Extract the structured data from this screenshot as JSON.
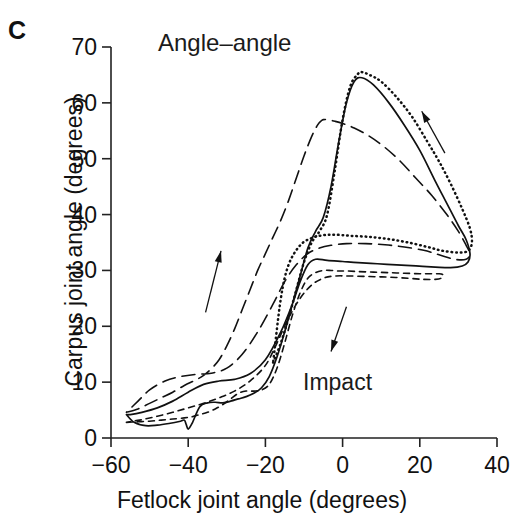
{
  "panel": {
    "label": "C"
  },
  "chart_data": {
    "type": "line",
    "title": "Angle–angle",
    "xlabel": "Fetlock joint angle (degrees)",
    "ylabel": "Carpus joint angle (degrees)",
    "xlim": [
      -60,
      40
    ],
    "ylim": [
      0,
      70
    ],
    "xticks": [
      -60,
      -40,
      -20,
      0,
      20,
      40
    ],
    "yticks": [
      0,
      10,
      20,
      30,
      40,
      50,
      60,
      70
    ],
    "xtick_labels": [
      "−60",
      "−40",
      "−20",
      "0",
      "20",
      "40"
    ],
    "ytick_labels": [
      "0",
      "10",
      "20",
      "30",
      "40",
      "50",
      "60",
      "70"
    ],
    "grid": false,
    "legend": "none",
    "annotations": [
      {
        "text": "Impact",
        "x": -2,
        "y": 12,
        "note": "arrow points down-left toward descending limb"
      },
      {
        "text": "",
        "x": 22,
        "y": 57,
        "note": "arrow pointing up-left along ascending right limb"
      },
      {
        "text": "",
        "x": -32,
        "y": 33,
        "note": "arrow pointing up along ascending left limb"
      }
    ],
    "series": [
      {
        "name": "solid",
        "style": "solid",
        "x": [
          -56,
          -54,
          -51,
          -48,
          -45,
          -42,
          -41,
          -40.5,
          -40,
          -39,
          -37,
          -35,
          -33,
          -31,
          -29,
          -27,
          -25,
          -23,
          -21,
          -19,
          -17,
          -15,
          -13,
          -11,
          -9,
          -7,
          -5,
          -3,
          -1,
          1,
          3,
          5,
          8,
          12,
          16,
          20,
          24,
          27,
          30,
          32,
          33,
          32.5,
          31,
          28,
          24,
          19,
          14,
          9,
          4,
          0,
          -4,
          -7,
          -9,
          -11,
          -13,
          -16,
          -20,
          -24,
          -28,
          -32,
          -36,
          -40,
          -44,
          -48,
          -52,
          -55,
          -56
        ],
        "y": [
          4.2,
          2.8,
          2.2,
          2.3,
          2.6,
          3.0,
          3.2,
          2.4,
          1.6,
          2.6,
          5.6,
          6.3,
          6.4,
          6.3,
          6.6,
          7.0,
          7.4,
          8.0,
          9.0,
          11.0,
          14.5,
          19.0,
          24.0,
          29.0,
          34.0,
          37.0,
          39.5,
          45.0,
          53.0,
          60.0,
          63.8,
          64.5,
          63.2,
          60.0,
          56.0,
          51.5,
          46.0,
          42.0,
          38.0,
          35.5,
          33.0,
          31.5,
          30.8,
          30.5,
          30.6,
          30.8,
          31.0,
          31.2,
          31.4,
          31.6,
          31.8,
          32.0,
          31.0,
          28.0,
          24.0,
          19.0,
          14.0,
          11.5,
          10.5,
          10.2,
          9.6,
          8.2,
          6.6,
          5.4,
          4.6,
          4.2,
          4.2
        ]
      },
      {
        "name": "dotted",
        "style": "dotted",
        "x": [
          -18,
          -16,
          -14,
          -12,
          -10,
          -8,
          -6,
          -4,
          -2,
          0,
          2,
          4,
          5,
          7,
          10,
          14,
          18,
          22,
          25,
          28,
          31,
          33,
          33.5,
          32.5,
          30,
          26,
          22,
          17,
          12,
          7,
          2,
          -2,
          -5,
          -8,
          -11,
          -14,
          -16,
          -18
        ],
        "y": [
          13.5,
          17.0,
          21.5,
          26.5,
          31.5,
          35.0,
          37.0,
          40.0,
          48.0,
          57.0,
          63.0,
          65.2,
          65.5,
          65.0,
          63.8,
          61.0,
          57.5,
          53.0,
          49.5,
          45.5,
          41.0,
          37.5,
          35.0,
          33.5,
          33.2,
          33.5,
          34.2,
          35.0,
          35.6,
          36.0,
          36.2,
          36.4,
          36.3,
          35.8,
          34.5,
          31.0,
          25.0,
          13.5
        ]
      },
      {
        "name": "long-dash",
        "style": "long-dash",
        "x": [
          -56,
          -53,
          -50,
          -47,
          -44,
          -41,
          -38,
          -36,
          -34,
          -32,
          -30,
          -28,
          -26,
          -24,
          -22,
          -20,
          -18,
          -16,
          -14,
          -12,
          -10,
          -8,
          -6.5,
          -5.5,
          -5,
          -4,
          -2,
          0,
          3,
          7,
          11,
          15,
          19,
          23,
          27,
          30,
          32,
          33,
          32,
          29,
          25,
          21,
          16,
          11,
          6,
          1,
          -3,
          -6,
          -9,
          -12,
          -15,
          -18,
          -22,
          -26,
          -30,
          -34,
          -38,
          -42,
          -46,
          -50,
          -53,
          -56
        ],
        "y": [
          4.6,
          5.2,
          6.2,
          7.2,
          8.2,
          9.4,
          10.4,
          11.2,
          12.4,
          14.0,
          16.5,
          19.5,
          23.0,
          26.5,
          30.0,
          33.0,
          36.0,
          39.0,
          42.5,
          46.5,
          50.5,
          54.0,
          56.0,
          56.8,
          57.0,
          57.0,
          56.7,
          56.3,
          55.5,
          54.0,
          52.0,
          49.5,
          46.5,
          43.5,
          40.0,
          37.0,
          34.5,
          33.0,
          32.0,
          32.0,
          32.8,
          33.6,
          34.2,
          34.6,
          34.8,
          34.8,
          34.5,
          34.0,
          33.0,
          31.0,
          28.0,
          24.0,
          19.0,
          15.0,
          12.5,
          11.6,
          11.4,
          11.0,
          10.2,
          8.6,
          6.6,
          4.6
        ]
      },
      {
        "name": "short-dash",
        "style": "short-dash",
        "x": [
          -56,
          -53,
          -50,
          -47,
          -44,
          -41,
          -39,
          -37,
          -35,
          -33,
          -31,
          -29,
          -27,
          -25,
          -23,
          -21,
          -19,
          -17,
          -15,
          -13,
          -11,
          -9,
          -7,
          -5,
          -3,
          -1,
          1,
          4,
          8,
          12,
          16,
          20,
          23,
          25,
          26,
          25.5,
          24,
          21,
          17,
          12,
          7,
          2,
          -2,
          -5,
          -8,
          -11,
          -14,
          -17,
          -20,
          -24,
          -28,
          -32,
          -36,
          -40,
          -44,
          -48,
          -52,
          -56
        ],
        "y": [
          2.8,
          2.9,
          3.0,
          3.2,
          3.4,
          3.6,
          3.8,
          4.2,
          4.6,
          5.2,
          6.0,
          7.0,
          8.0,
          8.4,
          8.4,
          8.6,
          9.6,
          12.5,
          17.0,
          22.0,
          26.0,
          28.6,
          29.6,
          30.0,
          30.0,
          29.9,
          29.9,
          29.8,
          29.7,
          29.6,
          29.5,
          29.4,
          29.4,
          29.4,
          29.2,
          28.6,
          28.4,
          28.4,
          28.6,
          28.8,
          28.9,
          29.0,
          29.0,
          28.6,
          27.4,
          25.0,
          21.5,
          17.0,
          13.0,
          10.2,
          8.4,
          7.2,
          6.2,
          5.4,
          4.6,
          3.9,
          3.3,
          2.8
        ]
      }
    ]
  }
}
